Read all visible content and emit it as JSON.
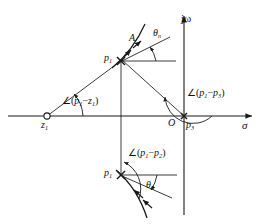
{
  "figure": {
    "type": "pole-zero-root-locus-diagram",
    "plane": "s-plane",
    "axes": {
      "real": {
        "label": "σ",
        "name": "sigma-axis",
        "y": 116,
        "x_start": 8,
        "x_end": 258
      },
      "imag": {
        "label": "jω",
        "name": "j-omega-axis",
        "x": 184,
        "y_start": 14,
        "y_end": 215
      }
    },
    "origin": {
      "label": "O",
      "x": 178,
      "y": 116
    },
    "points": [
      {
        "id": "z1",
        "label": "z",
        "sub": "1",
        "marker": "open-circle",
        "x": 47,
        "y": 116
      },
      {
        "id": "p1u",
        "label": "p",
        "sub": "1",
        "marker": "cross",
        "x": 120,
        "y": 61
      },
      {
        "id": "p3",
        "label": "p",
        "sub": "3",
        "marker": "cross",
        "x": 184,
        "y": 116
      },
      {
        "id": "p1l",
        "label": "p",
        "sub": "1",
        "marker": "cross",
        "x": 120,
        "y": 175
      }
    ],
    "angle_labels": [
      {
        "id": "ang-p1-z1",
        "text": "∠(p₁−z₁)",
        "base": "∠(",
        "a": "p",
        "asub": "1",
        "minus": "−",
        "b": "z",
        "bsub": "1",
        "close": ")",
        "x": 62,
        "y": 101
      },
      {
        "id": "ang-p1-p3",
        "text": "∠(p₁−p₃)",
        "base": "∠(",
        "a": "p",
        "asub": "1",
        "minus": "−",
        "b": "p",
        "bsub": "3",
        "close": ")",
        "x": 188,
        "y": 95
      },
      {
        "id": "ang-p1-p2",
        "text": "∠(p₁−p₂)",
        "base": "∠(",
        "a": "p",
        "asub": "1",
        "minus": "−",
        "b": "p",
        "bsub": "2",
        "close": ")",
        "x": 130,
        "y": 155
      }
    ],
    "theta_labels": [
      {
        "id": "theta-upper",
        "sym": "θ",
        "sub": "n",
        "x": 157,
        "y": 34
      },
      {
        "id": "theta-lower",
        "sym": "θ",
        "sub": "n",
        "x": 149,
        "y": 186
      }
    ],
    "departure_label": {
      "id": "A",
      "text": "A",
      "x": 133,
      "y": 39
    },
    "point_text": {
      "z1": "z",
      "z1_sub": "1",
      "p1_upper": "p",
      "p1_upper_sub": "1",
      "p1_lower": "p",
      "p1_lower_sub": "1",
      "p3": "p",
      "p3_sub": "3",
      "origin": "O"
    },
    "colors": {
      "line": "#1a1a1a",
      "text": "#111111",
      "background": "#ffffff"
    }
  }
}
